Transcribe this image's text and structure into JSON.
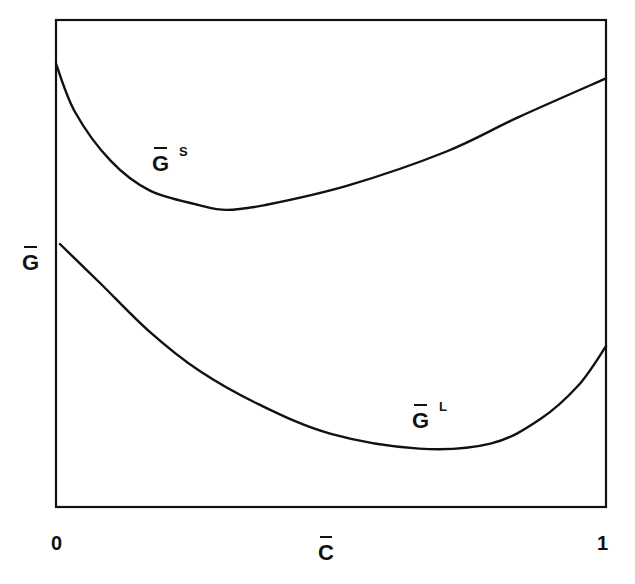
{
  "chart_data": {
    "type": "line",
    "title": "",
    "xlabel": "C̄",
    "ylabel": "Ḡ",
    "x_ticks": [
      "0",
      "1"
    ],
    "xlim": [
      0,
      1
    ],
    "ylim": "unlabeled (qualitative)",
    "grid": false,
    "legend": "inline curve labels",
    "series": [
      {
        "name": "Ḡ^S",
        "label_main": "G",
        "label_sup": "S",
        "description": "solid-phase free energy curve: high at C=0, minimum near C≈0.31, rises to right edge",
        "x": [
          0.0,
          0.035,
          0.1,
          0.17,
          0.26,
          0.31,
          0.38,
          0.53,
          0.71,
          0.84,
          1.0
        ],
        "y_rel": [
          0.91,
          0.81,
          0.71,
          0.65,
          0.62,
          0.61,
          0.62,
          0.66,
          0.73,
          0.8,
          0.88
        ]
      },
      {
        "name": "Ḡ^L",
        "label_main": "G",
        "label_sup": "L",
        "description": "liquid-phase free energy curve: starts mid-height at C=0, decreasing to minimum near C≈0.66, sharp rise toward C=1",
        "x": [
          0.007,
          0.08,
          0.17,
          0.26,
          0.37,
          0.5,
          0.66,
          0.79,
          0.88,
          0.95,
          1.0
        ],
        "y_rel": [
          0.54,
          0.46,
          0.36,
          0.28,
          0.21,
          0.15,
          0.12,
          0.13,
          0.18,
          0.25,
          0.33
        ]
      }
    ]
  },
  "axes": {
    "x_tick_min": "0",
    "x_tick_max": "1",
    "x_label": "C",
    "y_label": "G"
  },
  "curve_labels": {
    "solid": {
      "main": "G",
      "sup": "S"
    },
    "liquid": {
      "main": "G",
      "sup": "L"
    }
  },
  "colors": {
    "line": "#111111",
    "background": "#ffffff"
  }
}
